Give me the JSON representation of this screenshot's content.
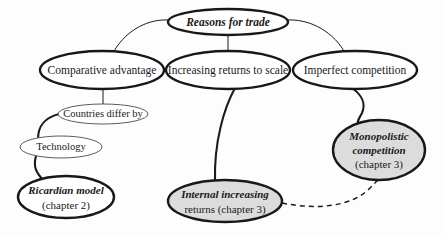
{
  "diagram": {
    "title": "Reasons for trade",
    "background_color": "#fdfdfd",
    "outline_color": "#181818",
    "shaded_fill_color": "#dcdcdc",
    "white_fill_color": "#ffffff",
    "nodes": [
      {
        "id": "reasons-for-trade",
        "label_lines": [
          "Reasons for trade"
        ],
        "style": "bold-italic",
        "fill": "white",
        "border": "thick",
        "cx": 228,
        "cy": 22,
        "rx": 60,
        "ry": 13
      },
      {
        "id": "comparative-advantage",
        "label_lines": [
          "Comparative advantage"
        ],
        "style": "roman",
        "fill": "white",
        "border": "thick",
        "cx": 102,
        "cy": 70,
        "rx": 62,
        "ry": 19
      },
      {
        "id": "increasing-returns-to-scale",
        "label_lines": [
          "Increasing returns to scale"
        ],
        "style": "roman",
        "fill": "white",
        "border": "thick",
        "cx": 228,
        "cy": 70,
        "rx": 62,
        "ry": 19
      },
      {
        "id": "imperfect-competition",
        "label_lines": [
          "Imperfect competition"
        ],
        "style": "roman",
        "fill": "white",
        "border": "thick",
        "cx": 355,
        "cy": 70,
        "rx": 62,
        "ry": 19
      },
      {
        "id": "countries-differ-by",
        "label_lines": [
          "Countries differ by"
        ],
        "style": "roman",
        "fill": "white",
        "border": "thin",
        "cx": 103,
        "cy": 114,
        "rx": 45,
        "ry": 10
      },
      {
        "id": "technology",
        "label_lines": [
          "Technology"
        ],
        "style": "roman",
        "fill": "white",
        "border": "thin",
        "cx": 61,
        "cy": 147,
        "rx": 41,
        "ry": 11
      },
      {
        "id": "ricardian-model",
        "label_lines": [
          "Ricardian model",
          "(chapter 2)"
        ],
        "line_styles": [
          "bold-italic",
          "roman"
        ],
        "style": "mixed",
        "fill": "white",
        "border": "thick",
        "cx": 66,
        "cy": 197,
        "rx": 48,
        "ry": 21
      },
      {
        "id": "internal-increasing-returns",
        "label_lines": [
          "Internal increasing",
          "returns (chapter 3)"
        ],
        "line_styles": [
          "bold-italic",
          "mixed"
        ],
        "style": "mixed",
        "fill": "shaded",
        "border": "thick",
        "cx": 225,
        "cy": 201,
        "rx": 57,
        "ry": 21
      },
      {
        "id": "monopolistic-competition",
        "label_lines": [
          "Monopolistic",
          "competition",
          "(chapter 3)"
        ],
        "line_styles": [
          "bold-italic",
          "bold-italic",
          "roman"
        ],
        "style": "mixed",
        "fill": "shaded",
        "border": "thick",
        "cx": 379,
        "cy": 150,
        "rx": 46,
        "ry": 30
      }
    ],
    "edges": [
      {
        "id": "edge-reasons-to-comparative",
        "from": "reasons-for-trade",
        "to": "comparative-advantage",
        "type": "curve",
        "weight": "thin"
      },
      {
        "id": "edge-reasons-to-increasing",
        "from": "reasons-for-trade",
        "to": "increasing-returns-to-scale",
        "type": "straight",
        "weight": "thin"
      },
      {
        "id": "edge-reasons-to-imperfect",
        "from": "reasons-for-trade",
        "to": "imperfect-competition",
        "type": "curve",
        "weight": "thin"
      },
      {
        "id": "edge-comparative-to-countries",
        "from": "comparative-advantage",
        "to": "countries-differ-by",
        "type": "straight",
        "weight": "thin"
      },
      {
        "id": "edge-countries-to-technology",
        "from": "countries-differ-by",
        "to": "technology",
        "type": "curve",
        "weight": "thick"
      },
      {
        "id": "edge-technology-to-ricardian",
        "from": "technology",
        "to": "ricardian-model",
        "type": "curve",
        "weight": "thick"
      },
      {
        "id": "edge-increasing-to-internal",
        "from": "increasing-returns-to-scale",
        "to": "internal-increasing-returns",
        "type": "curve",
        "weight": "thick"
      },
      {
        "id": "edge-imperfect-to-monopolistic",
        "from": "imperfect-competition",
        "to": "monopolistic-competition",
        "type": "s-curve",
        "weight": "thick"
      },
      {
        "id": "edge-internal-to-monopolistic",
        "from": "internal-increasing-returns",
        "to": "monopolistic-competition",
        "type": "dashed-curve",
        "weight": "dashed"
      }
    ]
  }
}
